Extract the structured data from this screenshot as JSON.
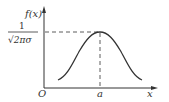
{
  "diagram": {
    "y_axis_label": "f(x)",
    "x_axis_label": "x",
    "origin_label": "O",
    "peak_x_label": "a",
    "peak_value_label": {
      "numerator": "1",
      "denominator": "√2πσ"
    },
    "colors": {
      "stroke": "#333333",
      "background": "#ffffff"
    }
  }
}
